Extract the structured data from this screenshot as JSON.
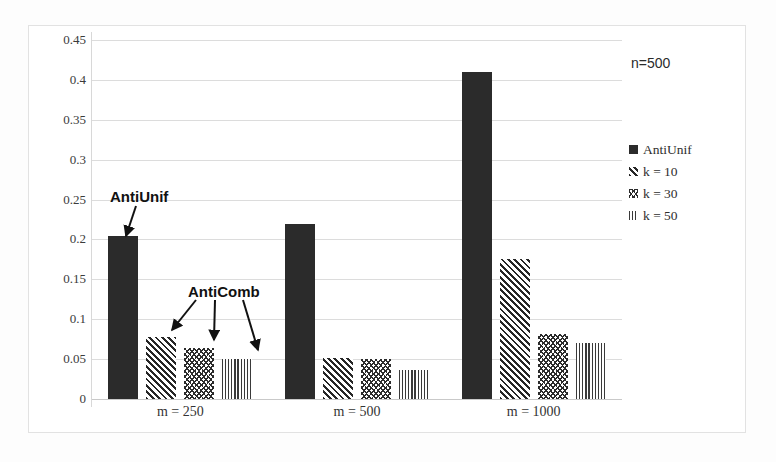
{
  "chart_data": {
    "type": "bar",
    "title": "",
    "xlabel": "",
    "ylabel": "",
    "ylim": [
      0,
      0.45
    ],
    "grid": true,
    "legend_position": "right",
    "categories": [
      "m = 250",
      "m = 500",
      "m = 1000"
    ],
    "ytick_labels": [
      "0.45",
      "0.4",
      "0.35",
      "0.3",
      "0.25",
      "0.2",
      "0.15",
      "0.1",
      "0.05",
      "0"
    ],
    "ytick_values": [
      0.45,
      0.4,
      0.35,
      0.3,
      0.25,
      0.2,
      0.15,
      0.1,
      0.05,
      0
    ],
    "series": [
      {
        "name": "AntiUnif",
        "pattern": "solid",
        "values": [
          0.204,
          0.22,
          0.41
        ]
      },
      {
        "name": "k = 10",
        "pattern": "diag",
        "values": [
          0.078,
          0.051,
          0.176
        ]
      },
      {
        "name": "k = 30",
        "pattern": "wave",
        "values": [
          0.064,
          0.05,
          0.082
        ]
      },
      {
        "name": "k = 50",
        "pattern": "vert",
        "values": [
          0.05,
          0.036,
          0.07
        ]
      }
    ],
    "annotations": [
      {
        "text": "AntiUnif",
        "points_to": [
          "series-0-group-0"
        ]
      },
      {
        "text": "AntiComb",
        "points_to": [
          "series-1-group-0",
          "series-2-group-0",
          "series-3-group-0"
        ]
      }
    ],
    "note": "n=500"
  },
  "legend": {
    "items": [
      {
        "label": "AntiUnif",
        "pattern": "solid"
      },
      {
        "label": "k = 10",
        "pattern": "diag"
      },
      {
        "label": "k = 30",
        "pattern": "wave"
      },
      {
        "label": "k = 50",
        "pattern": "vert"
      }
    ]
  },
  "colors": {
    "bar_dark": "#2b2b2b",
    "gridline": "#dcdcdc",
    "text": "#2e2e2e",
    "background": "#ffffff"
  }
}
